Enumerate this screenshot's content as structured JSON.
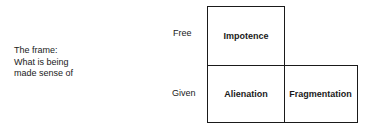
{
  "frame_label": {
    "lines": [
      "The frame:",
      "What is being",
      "made sense of"
    ]
  },
  "row_labels": {
    "free": "Free",
    "given": "Given"
  },
  "cells": {
    "impotence": "Impotence",
    "alienation": "Alienation",
    "fragmentation": "Fragmentation"
  }
}
